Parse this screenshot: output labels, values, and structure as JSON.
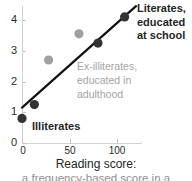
{
  "chart_data": {
    "type": "scatter",
    "title": "",
    "xlabel": "Reading score:",
    "ylabel": "",
    "xlim": [
      -6,
      127
    ],
    "ylim": [
      0,
      4.55
    ],
    "grid": false,
    "legend_position": "none",
    "x_ticks": [
      {
        "value": 0,
        "label": "0"
      },
      {
        "value": 50,
        "label": "50"
      },
      {
        "value": 100,
        "label": "100"
      }
    ],
    "y_ticks": [
      {
        "value": 0,
        "label": "0"
      },
      {
        "value": 1,
        "label": "1"
      },
      {
        "value": 2,
        "label": "2"
      },
      {
        "value": 3,
        "label": "3"
      },
      {
        "value": 4,
        "label": "4"
      }
    ],
    "series": [
      {
        "name": "Illiterates",
        "color": "#333333",
        "marker": "circle",
        "points": [
          {
            "x": 0,
            "y": 0.8
          },
          {
            "x": 13,
            "y": 1.25
          }
        ]
      },
      {
        "name": "Ex-illiterates, educated in adulthood",
        "color": "#a0a0a0",
        "marker": "circle",
        "points": [
          {
            "x": 28,
            "y": 2.7
          },
          {
            "x": 60,
            "y": 3.55
          }
        ]
      },
      {
        "name": "Literates, educated at school",
        "color": "#333333",
        "marker": "circle",
        "points": [
          {
            "x": 80,
            "y": 3.25
          },
          {
            "x": 108,
            "y": 4.1
          }
        ]
      }
    ],
    "trendline": {
      "name": "regression-line",
      "color": "#111111",
      "x_start": 0,
      "y_start": 1.15,
      "x_end": 120,
      "y_end": 4.45
    },
    "annotations": [
      {
        "id": "literates",
        "text": "Literates, educated at school",
        "color": "#262626",
        "bold": true
      },
      {
        "id": "ex-illiterates",
        "text": "Ex-illiterates, educated in adulthood",
        "color": "#a3a3a3",
        "bold": false
      },
      {
        "id": "illiterates",
        "text": "Illiterates",
        "color": "#262626",
        "bold": true
      }
    ]
  },
  "caption": {
    "line1": "Reading score:",
    "line2": "a frequency-based score in a"
  },
  "colors": {
    "dark_marker": "#333333",
    "gray_marker": "#a0a0a0",
    "line": "#111111",
    "axis": "#d2d2d2",
    "text": "#262626",
    "gray_text": "#a3a3a3"
  }
}
